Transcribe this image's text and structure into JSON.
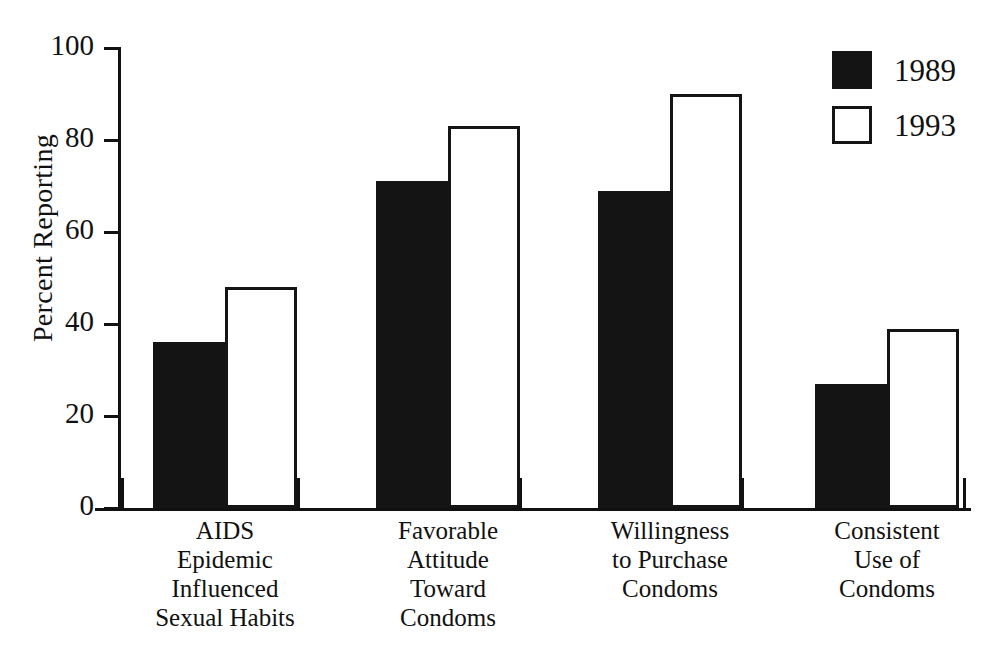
{
  "chart_data": {
    "type": "bar",
    "title": "",
    "subtitle": "",
    "xlabel": "",
    "ylabel": "Percent Reporting",
    "ylim": [
      0,
      100
    ],
    "yticks": [
      0,
      20,
      40,
      60,
      80,
      100
    ],
    "ytick_labels": [
      "0",
      "20",
      "40",
      "60",
      "80",
      "100"
    ],
    "grid": false,
    "legend_position": "top-right",
    "categories": [
      "AIDS Epidemic Influenced Sexual Habits",
      "Favorable Attitude Toward Condoms",
      "Willingness to Purchase Condoms",
      "Consistent Use of Condoms"
    ],
    "category_lines": [
      [
        "AIDS",
        "Epidemic",
        "Influenced",
        "Sexual Habits"
      ],
      [
        "Favorable",
        "Attitude",
        "Toward",
        "Condoms"
      ],
      [
        "Willingness",
        "to Purchase",
        "Condoms"
      ],
      [
        "Consistent",
        "Use of",
        "Condoms"
      ]
    ],
    "series": [
      {
        "name": "1989",
        "color": "#141414",
        "style": "filled",
        "values": [
          36,
          71,
          69,
          27
        ]
      },
      {
        "name": "1993",
        "color": "#ffffff",
        "style": "outlined",
        "values": [
          48,
          83,
          90,
          39
        ]
      }
    ]
  },
  "legend": {
    "items": [
      {
        "label": "1989",
        "swatch": "filled-black-square"
      },
      {
        "label": "1993",
        "swatch": "outlined-white-square"
      }
    ]
  },
  "axes": {
    "y_title": "Percent Reporting",
    "y_tick_labels": [
      "100",
      "80",
      "60",
      "40",
      "20",
      "0"
    ]
  }
}
